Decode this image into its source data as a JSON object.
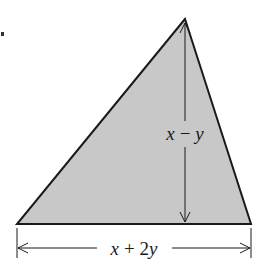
{
  "diagram": {
    "type": "triangle",
    "fill_color": "#c8c8c8",
    "stroke_color": "#1a1a1a",
    "background_color": "#ffffff",
    "vertices": {
      "apex": [
        185,
        19
      ],
      "base_left": [
        17,
        224
      ],
      "base_right": [
        251,
        224
      ]
    },
    "height_label": {
      "var1": "x",
      "op": "−",
      "var2": "y"
    },
    "base_label": {
      "var1": "x",
      "op": "+",
      "coef": "2",
      "var2": "y"
    }
  }
}
